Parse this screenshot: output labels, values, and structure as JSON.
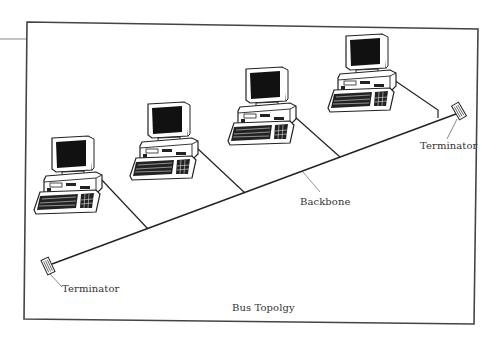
{
  "diagram": {
    "title": "Bus Topolgy",
    "type": "network-topology",
    "topology": "bus",
    "labels": {
      "backbone": "Backbone",
      "terminator_left": "Terminator",
      "terminator_right": "Terminator"
    },
    "nodes": [
      {
        "id": "computer-1",
        "kind": "desktop-computer"
      },
      {
        "id": "computer-2",
        "kind": "desktop-computer"
      },
      {
        "id": "computer-3",
        "kind": "desktop-computer"
      },
      {
        "id": "computer-4",
        "kind": "desktop-computer"
      }
    ],
    "edges": [
      {
        "from": "terminator-left",
        "to": "terminator-right",
        "kind": "backbone"
      },
      {
        "from": "computer-1",
        "to": "backbone",
        "kind": "drop-cable"
      },
      {
        "from": "computer-2",
        "to": "backbone",
        "kind": "drop-cable"
      },
      {
        "from": "computer-3",
        "to": "backbone",
        "kind": "drop-cable"
      },
      {
        "from": "computer-4",
        "to": "backbone",
        "kind": "drop-cable"
      }
    ],
    "colors": {
      "line": "#222222",
      "frame": "#444444",
      "screen": "#111111",
      "text": "#333333"
    }
  }
}
